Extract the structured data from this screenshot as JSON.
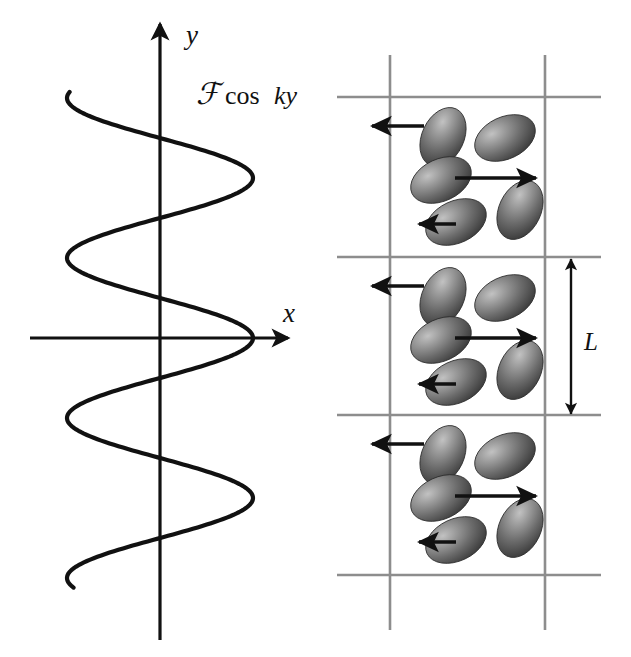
{
  "figure": {
    "background_color": "#ffffff",
    "width": 631,
    "height": 657
  },
  "left_panel": {
    "name": "force-wave-plot",
    "curve_label": {
      "script_f": "ℱ",
      "rest": "cos",
      "argument": "ky",
      "full_text": "ℱ cos ky"
    },
    "axes": {
      "y_axis_label": "y",
      "x_axis_label": "x",
      "origin_x": 160,
      "origin_y": 338,
      "y_axis_top": 24,
      "y_axis_bottom": 640,
      "x_axis_left": 30,
      "x_axis_right": 288,
      "stroke_color": "#111111",
      "stroke_width": 3.2
    },
    "curve": {
      "color": "#111111",
      "stroke_width": 4.2,
      "amplitude_px": 93,
      "center_x": 160,
      "wavelength_px": 160,
      "y_top": 92,
      "y_bottom": 588,
      "form": "x = F cos(k y)"
    }
  },
  "right_panel": {
    "name": "nematic-layers-diagram",
    "dimension_label": "L",
    "grid": {
      "color": "#8d8d8d",
      "stroke_width": 2.6,
      "vertical_lines_x": [
        390,
        545
      ],
      "vertical_top": 55,
      "vertical_bottom": 630,
      "horizontal_lines_y": [
        97,
        257,
        415,
        575
      ],
      "horizontal_left": 337,
      "horizontal_right": 601
    },
    "dimension_arrow": {
      "x": 571,
      "y_top": 259,
      "y_bottom": 414,
      "color": "#111111"
    },
    "cells": [
      {
        "name": "cell-top",
        "y_offset": 97,
        "ellipses": [
          {
            "cx": 443,
            "cy": 137,
            "rx": 21,
            "ry": 31,
            "angle": 25
          },
          {
            "cx": 505,
            "cy": 138,
            "rx": 32,
            "ry": 21,
            "angle": -25
          },
          {
            "cx": 441,
            "cy": 180,
            "rx": 32,
            "ry": 21,
            "angle": -25
          },
          {
            "cx": 520,
            "cy": 210,
            "rx": 21,
            "ry": 31,
            "angle": 25
          },
          {
            "cx": 456,
            "cy": 222,
            "rx": 32,
            "ry": 21,
            "angle": -25
          }
        ],
        "extra_ellipse": {
          "cx": 443,
          "cy": 137,
          "rx": 21,
          "ry": 31,
          "angle": 25
        },
        "arrows": [
          {
            "name": "arrow-left-upper",
            "x1": 424,
            "y1": 126,
            "x2": 372,
            "y2": 126,
            "dir": "left"
          },
          {
            "name": "arrow-right-middle",
            "x1": 455,
            "y1": 178,
            "x2": 536,
            "y2": 178,
            "dir": "right"
          },
          {
            "name": "arrow-left-lower",
            "x1": 456,
            "y1": 224,
            "x2": 419,
            "y2": 224,
            "dir": "left"
          }
        ]
      },
      {
        "name": "cell-middle",
        "y_offset": 257,
        "ellipses": [
          {
            "cx": 443,
            "cy": 297,
            "rx": 21,
            "ry": 31,
            "angle": 25
          },
          {
            "cx": 505,
            "cy": 298,
            "rx": 32,
            "ry": 21,
            "angle": -25
          },
          {
            "cx": 441,
            "cy": 340,
            "rx": 32,
            "ry": 21,
            "angle": -25
          },
          {
            "cx": 520,
            "cy": 370,
            "rx": 21,
            "ry": 31,
            "angle": 25
          },
          {
            "cx": 456,
            "cy": 382,
            "rx": 32,
            "ry": 21,
            "angle": -25
          }
        ],
        "arrows": [
          {
            "name": "arrow-left-upper",
            "x1": 424,
            "y1": 286,
            "x2": 372,
            "y2": 286,
            "dir": "left"
          },
          {
            "name": "arrow-right-middle",
            "x1": 455,
            "y1": 338,
            "x2": 536,
            "y2": 338,
            "dir": "right"
          },
          {
            "name": "arrow-left-lower",
            "x1": 456,
            "y1": 384,
            "x2": 419,
            "y2": 384,
            "dir": "left"
          }
        ]
      },
      {
        "name": "cell-bottom",
        "y_offset": 415,
        "ellipses": [
          {
            "cx": 443,
            "cy": 455,
            "rx": 21,
            "ry": 31,
            "angle": 25
          },
          {
            "cx": 505,
            "cy": 456,
            "rx": 32,
            "ry": 21,
            "angle": -25
          },
          {
            "cx": 441,
            "cy": 498,
            "rx": 32,
            "ry": 21,
            "angle": -25
          },
          {
            "cx": 520,
            "cy": 528,
            "rx": 21,
            "ry": 31,
            "angle": 25
          },
          {
            "cx": 456,
            "cy": 540,
            "rx": 32,
            "ry": 21,
            "angle": -25
          }
        ],
        "arrows": [
          {
            "name": "arrow-left-upper",
            "x1": 424,
            "y1": 444,
            "x2": 372,
            "y2": 444,
            "dir": "left"
          },
          {
            "name": "arrow-right-middle",
            "x1": 455,
            "y1": 496,
            "x2": 536,
            "y2": 496,
            "dir": "right"
          },
          {
            "name": "arrow-left-lower",
            "x1": 456,
            "y1": 542,
            "x2": 419,
            "y2": 542,
            "dir": "left"
          }
        ]
      }
    ],
    "ellipse_colors": {
      "highlight": "#b9b9b9",
      "mid": "#6e6e6e",
      "shadow": "#3a3a3a",
      "edge": "#2c2c2c"
    }
  }
}
